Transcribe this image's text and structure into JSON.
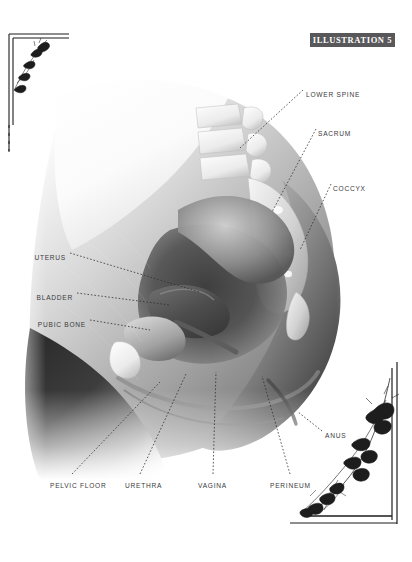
{
  "plate": {
    "badge_label": "ILLUSTRATION 5",
    "badge_color": "#58585a",
    "badge_text_color": "#ffffff",
    "background_color": "#ffffff",
    "label_color": "#3a3a3c",
    "leader_color": "#2e2e30"
  },
  "subject": {
    "title": "Female pelvic anatomy, mid-sagittal section",
    "rendering": "grayscale airbrush medical illustration"
  },
  "labels": [
    {
      "id": "lower-spine",
      "text": "LOWER SPINE",
      "x": 306,
      "y": 92,
      "align": "left"
    },
    {
      "id": "sacrum",
      "text": "SACRUM",
      "x": 318,
      "y": 131,
      "align": "left"
    },
    {
      "id": "coccyx",
      "text": "COCCYX",
      "x": 333,
      "y": 186,
      "align": "left"
    },
    {
      "id": "uterus",
      "text": "UTERUS",
      "x": 66,
      "y": 255,
      "align": "right"
    },
    {
      "id": "bladder",
      "text": "BLADDER",
      "x": 73,
      "y": 295,
      "align": "right"
    },
    {
      "id": "pubic-bone",
      "text": "PUBIC BONE",
      "x": 86,
      "y": 322,
      "align": "right"
    },
    {
      "id": "anus",
      "text": "ANUS",
      "x": 325,
      "y": 433,
      "align": "left"
    },
    {
      "id": "pelvic-floor",
      "text": "PELVIC FLOOR",
      "x": 50,
      "y": 483,
      "align": "left"
    },
    {
      "id": "urethra",
      "text": "URETHRA",
      "x": 125,
      "y": 483,
      "align": "left"
    },
    {
      "id": "vagina",
      "text": "VAGINA",
      "x": 198,
      "y": 483,
      "align": "left"
    },
    {
      "id": "perineum",
      "text": "PERINEUM",
      "x": 270,
      "y": 483,
      "align": "left"
    }
  ],
  "ornaments": {
    "top_left": "floral-corner-rule",
    "bottom_right": "flowering-vine-corner-rule"
  }
}
